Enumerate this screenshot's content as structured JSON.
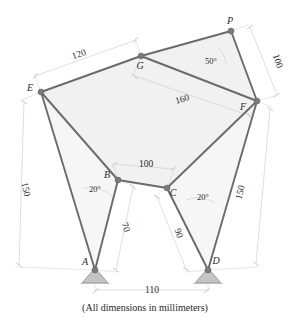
{
  "figure": {
    "caption": "(All dimensions in millimeters)",
    "units": "millimeters",
    "kind": "truss-structure-diagram"
  },
  "colors": {
    "member": "#6b6b6b",
    "panel_fill": "#f1f1f1",
    "dimension_line": "#c9c9c9",
    "support": "#c4c4c4",
    "joint": "#7a7a7a",
    "text": "#2b2b2b",
    "background": "#ffffff"
  },
  "nodes": [
    {
      "id": "A",
      "label": "A",
      "x": 95,
      "y": 270,
      "type": "pin-support",
      "label_dx": -10,
      "label_dy": -5
    },
    {
      "id": "B",
      "label": "B",
      "x": 118,
      "y": 180,
      "type": "joint",
      "label_dx": -11,
      "label_dy": -2
    },
    {
      "id": "C",
      "label": "C",
      "x": 167,
      "y": 188,
      "type": "joint",
      "label_dx": 4,
      "label_dy": 8
    },
    {
      "id": "D",
      "label": "D",
      "x": 208,
      "y": 270,
      "type": "pin-support",
      "label_dx": 6,
      "label_dy": -6
    },
    {
      "id": "E",
      "label": "E",
      "x": 41,
      "y": 92,
      "type": "joint",
      "label_dx": -11,
      "label_dy": -1
    },
    {
      "id": "F",
      "label": "F",
      "x": 257,
      "y": 101,
      "type": "joint",
      "label_dx": -14,
      "label_dy": 9
    },
    {
      "id": "G",
      "label": "G",
      "x": 141,
      "y": 56,
      "type": "joint",
      "label_dx": -3,
      "label_dy": 13
    },
    {
      "id": "P",
      "label": "P",
      "x": 231,
      "y": 31,
      "type": "joint",
      "label_dx": -2,
      "label_dy": -6
    }
  ],
  "members": [
    {
      "from": "E",
      "to": "G"
    },
    {
      "from": "G",
      "to": "P"
    },
    {
      "from": "P",
      "to": "F"
    },
    {
      "from": "G",
      "to": "F"
    },
    {
      "from": "E",
      "to": "B"
    },
    {
      "from": "E",
      "to": "A"
    },
    {
      "from": "B",
      "to": "C"
    },
    {
      "from": "B",
      "to": "A"
    },
    {
      "from": "C",
      "to": "F"
    },
    {
      "from": "C",
      "to": "D"
    },
    {
      "from": "F",
      "to": "D"
    }
  ],
  "panels": [
    {
      "name": "upper-left-panel",
      "points": "41,92 141,56 231,31 257,101 167,188 118,180"
    },
    {
      "name": "left-lower-panel",
      "points": "41,92 118,180 95,270"
    },
    {
      "name": "right-lower-panel",
      "points": "257,101 208,270 167,188"
    }
  ],
  "dimensions": [
    {
      "id": "dim-EG",
      "label": "120",
      "x": 80,
      "y": 57,
      "rotate": -20
    },
    {
      "id": "dim-GF",
      "label": "160",
      "x": 183,
      "y": 102,
      "rotate": -16
    },
    {
      "id": "dim-PF",
      "label": "100",
      "x": 275,
      "y": 62,
      "rotate": 71
    },
    {
      "id": "dim-EA",
      "label": "150",
      "x": 23,
      "y": 190,
      "rotate": 78
    },
    {
      "id": "dim-FD",
      "label": "150",
      "x": 243,
      "y": 193,
      "rotate": -75
    },
    {
      "id": "dim-BC",
      "label": "100",
      "x": 146,
      "y": 167,
      "rotate": 0
    },
    {
      "id": "dim-BA",
      "label": "70",
      "x": 123,
      "y": 228,
      "rotate": 73
    },
    {
      "id": "dim-CD",
      "label": "90",
      "x": 176,
      "y": 234,
      "rotate": 73
    },
    {
      "id": "dim-AD",
      "label": "110",
      "x": 152,
      "y": 293,
      "rotate": 0
    }
  ],
  "angles": [
    {
      "id": "angle-P",
      "label": "50°",
      "x": 211,
      "y": 64
    },
    {
      "id": "angle-B",
      "label": "20°",
      "x": 95,
      "y": 192
    },
    {
      "id": "angle-C",
      "label": "20°",
      "x": 203,
      "y": 200
    }
  ]
}
